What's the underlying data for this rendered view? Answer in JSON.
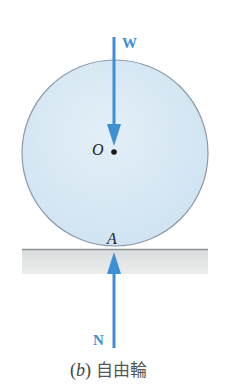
{
  "figure": {
    "caption": {
      "part_open": "(",
      "part": "b",
      "part_close": ")",
      "title": "自由輪"
    },
    "labels": {
      "weight_force": "W",
      "normal_force": "N",
      "center_point": "O",
      "contact_point": "A"
    },
    "colors": {
      "wheel_fill": "#d6e8f4",
      "wheel_stroke": "#8a9aa6",
      "force_arrow": "#3d8fd6",
      "ground_fill": "#e2e4e4",
      "ground_line": "#8f9394",
      "point_dot": "#1a1a1a"
    },
    "geometry": {
      "wheel_center": [
        115,
        153
      ],
      "wheel_radius": 93,
      "ground": {
        "x": 22,
        "y": 249,
        "width": 186,
        "height": 25
      },
      "weight_arrow": {
        "x": 114,
        "y_start": 37,
        "y_tip": 146
      },
      "normal_arrow": {
        "x": 114,
        "y_start": 348,
        "y_tip": 252
      }
    }
  }
}
